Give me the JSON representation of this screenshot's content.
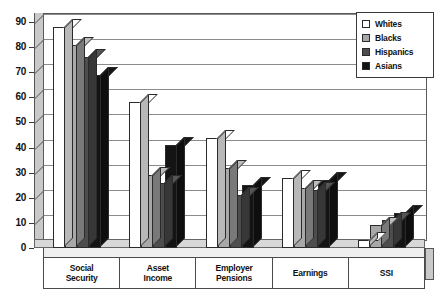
{
  "chart_data": {
    "type": "bar",
    "title": "",
    "xlabel": "",
    "ylabel": "",
    "ylim": [
      0,
      90
    ],
    "yticks": [
      0,
      10,
      20,
      30,
      40,
      50,
      60,
      70,
      80,
      90
    ],
    "ytick_labels": [
      "0",
      "10",
      "20",
      "30",
      "40",
      "50",
      "60",
      "70",
      "80",
      "90"
    ],
    "grid": true,
    "legend_position": "top-right",
    "style": "3d-grouped-bar",
    "categories": [
      "Social Security",
      "Asset Income",
      "Employer Pensions",
      "Earnings",
      "SSI"
    ],
    "category_lines": [
      [
        "Social",
        "Security"
      ],
      [
        "Asset",
        "Income"
      ],
      [
        "Employer",
        "Pensions"
      ],
      [
        "Earnings"
      ],
      [
        "SSI"
      ]
    ],
    "series": [
      {
        "name": "Whites",
        "color": "#ffffff",
        "values": [
          88,
          58,
          44,
          28,
          3
        ]
      },
      {
        "name": "Blacks",
        "color": "#a8a8a8",
        "values": [
          81,
          29,
          32,
          24,
          9
        ]
      },
      {
        "name": "Hispanics",
        "color": "#4d4d4d",
        "values": [
          76,
          26,
          21,
          23,
          11
        ]
      },
      {
        "name": "Asians",
        "color": "#141414",
        "values": [
          69,
          41,
          25,
          27,
          14
        ]
      }
    ]
  },
  "legend": {
    "items": [
      {
        "label": "Whites"
      },
      {
        "label": "Blacks"
      },
      {
        "label": "Hispanics"
      },
      {
        "label": "Asians"
      }
    ]
  },
  "colors": {
    "whites": "#ffffff",
    "blacks": "#a8a8a8",
    "hispanics": "#4d4d4d",
    "asians": "#141414",
    "grid": "#8b8b8b",
    "axis": "#3a3a3a",
    "wall": "#c9c9c9",
    "floor": "#d8d8d8"
  }
}
